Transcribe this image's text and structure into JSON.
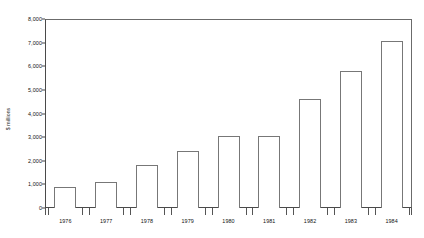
{
  "chart_data": {
    "type": "bar",
    "title": "",
    "subtitle": "",
    "xlabel": "",
    "ylabel": "$ millions",
    "categories": [
      "1976",
      "1977",
      "1978",
      "1979",
      "1980",
      "1981",
      "1982",
      "1983",
      "1984"
    ],
    "values": [
      900,
      1100,
      1800,
      2400,
      3050,
      3050,
      4600,
      5800,
      7050
    ],
    "series": [
      {
        "name": "",
        "values": [
          900,
          1100,
          1800,
          2400,
          3050,
          3050,
          4600,
          5800,
          7050
        ]
      }
    ],
    "ylim": [
      0,
      8000
    ],
    "ytick_labels": [
      "0",
      "1,000",
      "2,000",
      "3,000",
      "4,000",
      "5,000",
      "6,000",
      "7,000",
      "8,000"
    ],
    "ytick_values": [
      0,
      1000,
      2000,
      3000,
      4000,
      5000,
      6000,
      7000,
      8000
    ],
    "grid": false,
    "legend": null,
    "legend_position": "none",
    "bar_fill_color": "#ffffff",
    "bar_border_color": "#777777",
    "axis_color": "#4a4a4a",
    "text_color": "#111111",
    "background_color": "#ffffff",
    "annotations": []
  }
}
